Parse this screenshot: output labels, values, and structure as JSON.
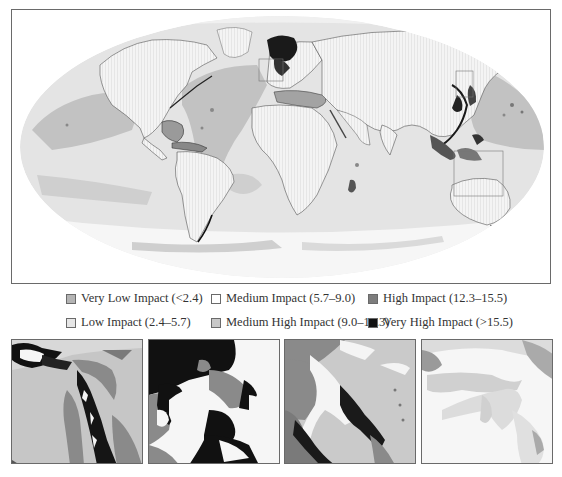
{
  "legend": {
    "items": [
      {
        "label": "Very Low Impact (<2.4)",
        "color": "#b4b4b4",
        "col": 0,
        "row": 0
      },
      {
        "label": "Low Impact (2.4–5.7)",
        "color": "#e6e6e6",
        "col": 0,
        "row": 1
      },
      {
        "label": "Medium Impact (5.7–9.0)",
        "color": "#ffffff",
        "col": 1,
        "row": 0
      },
      {
        "label": "Medium High Impact (9.0–12.3)",
        "color": "#c8c8c8",
        "col": 1,
        "row": 1
      },
      {
        "label": "High Impact (12.3–15.5)",
        "color": "#7d7d7d",
        "col": 2,
        "row": 0
      },
      {
        "label": "Very High Impact (>15.5)",
        "color": "#111111",
        "col": 2,
        "row": 1
      }
    ]
  },
  "colors": {
    "land": "#f2f2f2",
    "ocean_low": "#e4e4e4",
    "ocean_verylow": "#cfcfcf",
    "ocean_medhigh": "#bdbdbd",
    "high": "#7d7d7d",
    "very_high": "#141414",
    "frame": "#6a6a6a"
  },
  "map": {
    "projection": "mollweide",
    "inset_boxes": [
      {
        "name": "north-sea-box",
        "x": 258,
        "y": 58,
        "w": 24,
        "h": 22
      },
      {
        "name": "japan-box",
        "x": 455,
        "y": 70,
        "w": 17,
        "h": 26
      },
      {
        "name": "coral-triangle-box",
        "x": 453,
        "y": 150,
        "w": 49,
        "h": 45
      }
    ]
  },
  "insets": [
    {
      "name": "inset-japan-east-china-sea",
      "left": 11
    },
    {
      "name": "inset-north-sea",
      "left": 148
    },
    {
      "name": "inset-caribbean-eastern-us",
      "left": 284
    },
    {
      "name": "inset-coral-triangle",
      "left": 421
    }
  ]
}
